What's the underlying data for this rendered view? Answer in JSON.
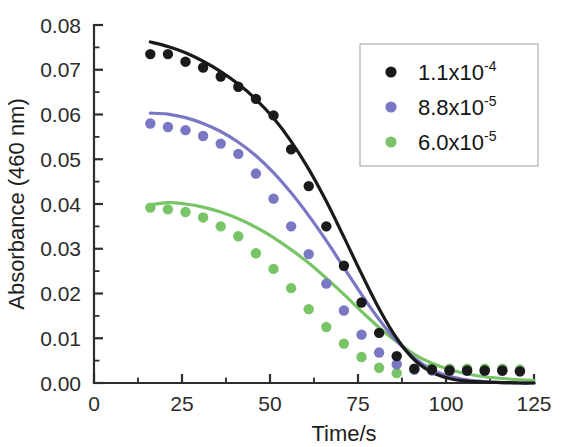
{
  "chart_data": {
    "type": "scatter",
    "title": "",
    "xlabel": "Time/s",
    "ylabel": "Absorbance (460 nm)",
    "xlim": [
      0,
      125
    ],
    "ylim": [
      0.0,
      0.08
    ],
    "xticks": [
      "0",
      "25",
      "50",
      "75",
      "100",
      "125"
    ],
    "xtick_values": [
      0,
      25,
      50,
      75,
      100,
      125
    ],
    "yticks": [
      "0.00",
      "0.01",
      "0.02",
      "0.03",
      "0.04",
      "0.05",
      "0.06",
      "0.07",
      "0.08"
    ],
    "ytick_values": [
      0.0,
      0.01,
      0.02,
      0.03,
      0.04,
      0.05,
      0.06,
      0.07,
      0.08
    ],
    "grid": false,
    "legend_position": "upper right",
    "minor_ticks_per_interval": 1,
    "series": [
      {
        "name": "1.1x10-4",
        "label_mantissa": "1.1x10",
        "label_exponent": "-4",
        "color": "#1a1a1a",
        "marker": "circle",
        "x": [
          16,
          21,
          26,
          31,
          36,
          41,
          46,
          51,
          56,
          61,
          66,
          71,
          76,
          81,
          86,
          91,
          96,
          101,
          106,
          111,
          116,
          121
        ],
        "y": [
          0.0735,
          0.0735,
          0.0718,
          0.0705,
          0.0685,
          0.0662,
          0.0635,
          0.0598,
          0.0522,
          0.044,
          0.035,
          0.0262,
          0.018,
          0.0112,
          0.006,
          0.0032,
          0.003,
          0.0028,
          0.0028,
          0.0028,
          0.0028,
          0.0026
        ],
        "fit_x": [
          16,
          21,
          26,
          31,
          36,
          41,
          46,
          51,
          56,
          61,
          66,
          71,
          76,
          81,
          86,
          91,
          96,
          101,
          106,
          111,
          116,
          121,
          125
        ],
        "fit_y": [
          0.0762,
          0.0752,
          0.0738,
          0.0719,
          0.0696,
          0.0668,
          0.0634,
          0.0592,
          0.054,
          0.0478,
          0.0406,
          0.0326,
          0.0244,
          0.0166,
          0.01,
          0.0052,
          0.0024,
          0.001,
          0.0004,
          0.0002,
          0.0001,
          0.0,
          0.0
        ]
      },
      {
        "name": "8.8x10-5",
        "label_mantissa": "8.8x10",
        "label_exponent": "-5",
        "color": "#7a77c4",
        "marker": "circle",
        "x": [
          16,
          21,
          26,
          31,
          36,
          41,
          46,
          51,
          56,
          61,
          66,
          71,
          76,
          81,
          86,
          91,
          96,
          101,
          106,
          111,
          116,
          121
        ],
        "y": [
          0.058,
          0.0572,
          0.0565,
          0.0552,
          0.0535,
          0.0512,
          0.0468,
          0.0412,
          0.035,
          0.0288,
          0.0222,
          0.0162,
          0.0108,
          0.0068,
          0.0042,
          0.003,
          0.0028,
          0.0028,
          0.0027,
          0.0027,
          0.0027,
          0.0026
        ],
        "fit_x": [
          16,
          21,
          26,
          31,
          36,
          41,
          46,
          51,
          56,
          61,
          66,
          71,
          76,
          81,
          86,
          91,
          96,
          101,
          106,
          111,
          116,
          121,
          125
        ],
        "fit_y": [
          0.0603,
          0.0601,
          0.0593,
          0.058,
          0.0562,
          0.0538,
          0.0508,
          0.047,
          0.0425,
          0.0374,
          0.0318,
          0.0258,
          0.0198,
          0.0142,
          0.0094,
          0.0056,
          0.003,
          0.0015,
          0.0007,
          0.0003,
          0.0001,
          0.0,
          0.0
        ]
      },
      {
        "name": "6.0x10-5",
        "label_mantissa": "6.0x10",
        "label_exponent": "-5",
        "color": "#79c466",
        "marker": "circle",
        "x": [
          16,
          21,
          26,
          31,
          36,
          41,
          46,
          51,
          56,
          61,
          66,
          71,
          76,
          81,
          86,
          91,
          96,
          101,
          106,
          111,
          116,
          121
        ],
        "y": [
          0.0392,
          0.0388,
          0.0382,
          0.037,
          0.035,
          0.0328,
          0.029,
          0.0255,
          0.0212,
          0.0165,
          0.0125,
          0.0088,
          0.0058,
          0.0034,
          0.0022,
          0.003,
          0.0034,
          0.0032,
          0.0032,
          0.0032,
          0.0032,
          0.003
        ],
        "fit_x": [
          16,
          21,
          26,
          31,
          36,
          41,
          46,
          51,
          56,
          61,
          66,
          71,
          76,
          81,
          86,
          91,
          96,
          101,
          106,
          111,
          116,
          121,
          125
        ],
        "fit_y": [
          0.0398,
          0.0403,
          0.04,
          0.0393,
          0.0382,
          0.0367,
          0.0348,
          0.0325,
          0.0298,
          0.0268,
          0.0234,
          0.0198,
          0.016,
          0.0124,
          0.0092,
          0.0064,
          0.0044,
          0.003,
          0.002,
          0.0014,
          0.001,
          0.0007,
          0.0006
        ]
      }
    ]
  },
  "axes": {
    "x_title": "Time/s",
    "y_title": "Absorbance (460 nm)"
  },
  "legend": {
    "entries": [
      {
        "mantissa": "1.1x10",
        "exponent": "-4",
        "color": "#1a1a1a"
      },
      {
        "mantissa": "8.8x10",
        "exponent": "-5",
        "color": "#7a77c4"
      },
      {
        "mantissa": "6.0x10",
        "exponent": "-5",
        "color": "#79c466"
      }
    ]
  }
}
